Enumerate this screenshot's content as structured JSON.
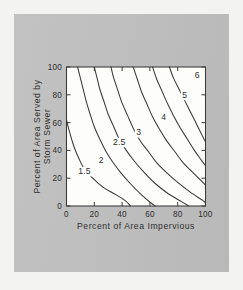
{
  "figure": {
    "background_color": "#f3f3f1",
    "panel_color": "#bfbfbf",
    "plot_background_color": "#fdfdfc",
    "line_color": "#3a3a3a"
  },
  "chart_data": {
    "type": "line",
    "title": "",
    "xlabel": "Percent of Area Impervious",
    "ylabel": "Percent of Area Served by Storm Sewer",
    "ylabel_lines": [
      "Percent of Area Served by",
      "Storm Sewer"
    ],
    "xlim": [
      0,
      100
    ],
    "ylim": [
      0,
      100
    ],
    "xticks": [
      0,
      20,
      40,
      60,
      80,
      100
    ],
    "yticks": [
      0,
      20,
      40,
      60,
      80,
      100
    ],
    "xtick_labels": [
      "0",
      "20",
      "40",
      "60",
      "80",
      "100"
    ],
    "ytick_labels": [
      "0",
      "20",
      "40",
      "60",
      "80",
      "100"
    ],
    "grid": false,
    "legend": "none",
    "contour_labels": [
      "1.5",
      "2",
      "2.5",
      "3",
      "4",
      "5",
      "6"
    ],
    "series": [
      {
        "name": "1.5",
        "label": "1.5",
        "label_x": 13,
        "label_y": 23,
        "points": [
          [
            0,
            62
          ],
          [
            2,
            54
          ],
          [
            4,
            47
          ],
          [
            6,
            41
          ],
          [
            9,
            34
          ],
          [
            12,
            28
          ],
          [
            16,
            23
          ],
          [
            21,
            18
          ],
          [
            27,
            13
          ],
          [
            34,
            9
          ],
          [
            42,
            4
          ],
          [
            46,
            0
          ]
        ]
      },
      {
        "name": "2",
        "label": "2",
        "label_x": 25,
        "label_y": 31,
        "points": [
          [
            8,
            100
          ],
          [
            10,
            92
          ],
          [
            12,
            84
          ],
          [
            14,
            76
          ],
          [
            17,
            66
          ],
          [
            20,
            57
          ],
          [
            24,
            48
          ],
          [
            28,
            40
          ],
          [
            33,
            32
          ],
          [
            39,
            24
          ],
          [
            46,
            16
          ],
          [
            54,
            8
          ],
          [
            61,
            2
          ],
          [
            64,
            0
          ]
        ]
      },
      {
        "name": "2.5",
        "label": "2.5",
        "label_x": 38,
        "label_y": 44,
        "points": [
          [
            20,
            100
          ],
          [
            22,
            92
          ],
          [
            24,
            84
          ],
          [
            27,
            75
          ],
          [
            30,
            66
          ],
          [
            34,
            57
          ],
          [
            38,
            48
          ],
          [
            43,
            40
          ],
          [
            49,
            32
          ],
          [
            56,
            24
          ],
          [
            64,
            16
          ],
          [
            73,
            9
          ],
          [
            83,
            3
          ],
          [
            88,
            0
          ]
        ]
      },
      {
        "name": "3",
        "label": "3",
        "label_x": 52,
        "label_y": 51,
        "points": [
          [
            32,
            100
          ],
          [
            34,
            92
          ],
          [
            37,
            83
          ],
          [
            40,
            74
          ],
          [
            44,
            65
          ],
          [
            48,
            56
          ],
          [
            53,
            47
          ],
          [
            59,
            39
          ],
          [
            65,
            31
          ],
          [
            72,
            24
          ],
          [
            80,
            17
          ],
          [
            89,
            10
          ],
          [
            98,
            4
          ],
          [
            100,
            2
          ]
        ]
      },
      {
        "name": "4",
        "label": "4",
        "label_x": 70,
        "label_y": 62,
        "points": [
          [
            48,
            100
          ],
          [
            51,
            91
          ],
          [
            54,
            82
          ],
          [
            58,
            73
          ],
          [
            62,
            64
          ],
          [
            67,
            55
          ],
          [
            72,
            47
          ],
          [
            78,
            39
          ],
          [
            84,
            31
          ],
          [
            91,
            24
          ],
          [
            97,
            18
          ],
          [
            100,
            15
          ]
        ]
      },
      {
        "name": "5",
        "label": "5",
        "label_x": 85,
        "label_y": 78,
        "points": [
          [
            62,
            100
          ],
          [
            65,
            91
          ],
          [
            69,
            82
          ],
          [
            73,
            73
          ],
          [
            77,
            65
          ],
          [
            82,
            56
          ],
          [
            87,
            48
          ],
          [
            92,
            40
          ],
          [
            97,
            33
          ],
          [
            100,
            29
          ]
        ]
      },
      {
        "name": "6",
        "label": "6",
        "label_x": 94,
        "label_y": 92,
        "points": [
          [
            74,
            100
          ],
          [
            77,
            92
          ],
          [
            81,
            84
          ],
          [
            85,
            76
          ],
          [
            89,
            68
          ],
          [
            93,
            60
          ],
          [
            97,
            52
          ],
          [
            100,
            46
          ]
        ]
      }
    ]
  }
}
